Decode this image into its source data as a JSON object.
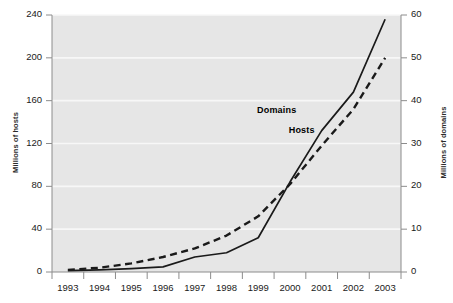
{
  "chart_data": {
    "type": "line",
    "title": "",
    "xlabel": "",
    "ylabel": "Millions of hosts",
    "ylabel_right": "Millions of domains",
    "x": [
      1993,
      1994,
      1995,
      1996,
      1997,
      1998,
      1999,
      2000,
      2001,
      2002,
      2003
    ],
    "categories": [
      "1993",
      "1994",
      "1995",
      "1996",
      "1997",
      "1998",
      "1999",
      "2000",
      "2001",
      "2002",
      "2003"
    ],
    "ylim": [
      0,
      240
    ],
    "ylim_right": [
      0,
      60
    ],
    "yticks": [
      0,
      40,
      80,
      120,
      160,
      200,
      240
    ],
    "yticks_right": [
      0,
      10,
      20,
      30,
      40,
      50,
      60
    ],
    "grid": true,
    "legend_position": "inline-annotations",
    "series": [
      {
        "name": "Hosts",
        "axis": "left",
        "units": "Millions of hosts",
        "style": "dashed",
        "color": "#1a1a1a",
        "values": [
          2,
          4,
          8,
          14,
          22,
          34,
          52,
          82,
          118,
          152,
          200
        ]
      },
      {
        "name": "Domains",
        "axis": "right",
        "units": "Millions of domains",
        "style": "solid",
        "color": "#1a1a1a",
        "values": [
          0.3,
          0.5,
          0.8,
          1.2,
          3.5,
          4.5,
          8,
          21,
          33,
          42,
          59
        ]
      }
    ],
    "annotations": [
      {
        "text": "Domains",
        "x": 2000.6,
        "y_right": 37.5
      },
      {
        "text": "Hosts",
        "x": 2001.6,
        "y_right": 33.0
      }
    ]
  },
  "axes": {
    "left_title": "Millions of hosts",
    "right_title": "Millions of domains",
    "left_ticks": [
      "0",
      "40",
      "80",
      "120",
      "160",
      "200",
      "240"
    ],
    "right_ticks": [
      "0",
      "10",
      "20",
      "30",
      "40",
      "50",
      "60"
    ],
    "x_ticks": [
      "1993",
      "1994",
      "1995",
      "1996",
      "1997",
      "1998",
      "1999",
      "2000",
      "2001",
      "2002",
      "2003"
    ]
  },
  "annotations": {
    "domains_label": "Domains",
    "hosts_label": "Hosts"
  },
  "colors": {
    "plot_background": "#e6e6e6",
    "gridline": "#f7f7f7",
    "line": "#1a1a1a",
    "axis": "#8c8c8c",
    "text": "#1a1a1a"
  }
}
